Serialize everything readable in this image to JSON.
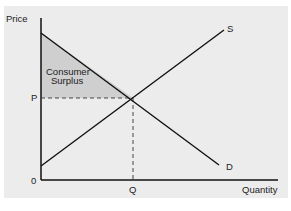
{
  "diagram": {
    "type": "supply-demand",
    "y_axis_label": "Price",
    "x_axis_label": "Quantity",
    "origin_label": "0",
    "price_label": "P",
    "quantity_label": "Q",
    "supply_label": "S",
    "demand_label": "D",
    "region_label_line1": "Consumer",
    "region_label_line2": "Surplus",
    "colors": {
      "panel": "#ececec",
      "surplus_fill": "#cfcfcf",
      "lines": "#111111"
    }
  }
}
